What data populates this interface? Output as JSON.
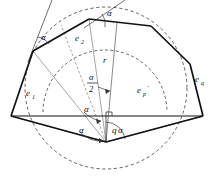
{
  "figure": {
    "background_color": "#ffffff",
    "stroke_color": "#111111",
    "dashed_color": "#3a3a3a",
    "thin_color": "#555555",
    "width": 212,
    "height": 184
  },
  "labels": {
    "edge_1": "e",
    "edge_1_sub": "1",
    "edge_2": "e",
    "edge_2_sub": "2",
    "edge_p_prime": "e",
    "edge_p_prime_sub": "p",
    "edge_p_prime_mark": "'",
    "edge_q": "e",
    "edge_q_sub": "q",
    "radius": "r",
    "alpha_top_right": "α",
    "alpha_upper_left": "α",
    "alpha_half_num": "α",
    "alpha_half_den": "2",
    "alpha_center_upper": "α",
    "alpha_center_lower": "α",
    "q_alpha_coef": "q",
    "q_alpha_symbol": "α"
  },
  "geometry": {
    "circle": {
      "center_x": 106,
      "center_y": 88,
      "radius": 81,
      "style": "dashed"
    },
    "apex": {
      "x": 106,
      "y": 142
    },
    "vertices": [
      {
        "name": "left-base",
        "x": 11,
        "y": 116
      },
      {
        "name": "upper-left",
        "x": 33,
        "y": 51
      },
      {
        "name": "top",
        "x": 89,
        "y": 19
      },
      {
        "name": "top-right",
        "x": 151,
        "y": 26
      },
      {
        "name": "right-base",
        "x": 203,
        "y": 116
      }
    ],
    "arcs": {
      "inner_arc_label": "e_p'",
      "inner_arc_style": "dashed"
    },
    "right_angle_marker": {
      "x": 106,
      "y": 116
    }
  },
  "annotations": {
    "angle_arcs": [
      "alpha at upper-left vertex between tangent and edge",
      "alpha at top vertex between tangent and edge",
      "alpha/2 between radius r and bisector at center",
      "alpha at apex above baseline",
      "alpha at apex below baseline",
      "q*alpha at apex right of vertical"
    ]
  }
}
